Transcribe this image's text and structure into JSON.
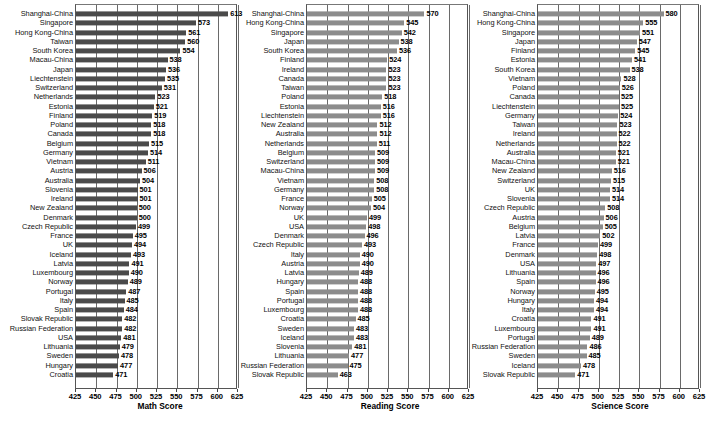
{
  "figure": {
    "panel_count": 3,
    "bar_color_math": "#4a4a4a",
    "bar_color_reading": "#8c8c8c",
    "bar_color_science": "#8c8c8c",
    "grid_color": "#6a6a6a",
    "background": "#ffffff"
  },
  "chart_data": [
    {
      "type": "bar",
      "orientation": "horizontal",
      "title": "",
      "xlabel": "Math Score",
      "ylabel": "",
      "xlim": [
        425,
        625
      ],
      "xticks": [
        425,
        450,
        475,
        500,
        525,
        550,
        575,
        600,
        625
      ],
      "grid": true,
      "legend": "none",
      "color": "#4a4a4a",
      "categories": [
        "Shanghai-China",
        "Singapore",
        "Hong Kong-China",
        "Taiwan",
        "South Korea",
        "Macau-China",
        "Japan",
        "Liechtenstein",
        "Switzerland",
        "Netherlands",
        "Estonia",
        "Finland",
        "Poland",
        "Canada",
        "Belgium",
        "Germany",
        "Vietnam",
        "Austria",
        "Australia",
        "Slovenia",
        "Ireland",
        "New Zealand",
        "Denmark",
        "Czech Republic",
        "France",
        "UK",
        "Iceland",
        "Latvia",
        "Luxembourg",
        "Norway",
        "Portugal",
        "Italy",
        "Spain",
        "Slovak Republic",
        "Russian Federation",
        "USA",
        "Lithuania",
        "Sweden",
        "Hungary",
        "Croatia"
      ],
      "values": [
        613,
        573,
        561,
        560,
        554,
        538,
        536,
        535,
        531,
        523,
        521,
        519,
        518,
        518,
        515,
        514,
        511,
        506,
        504,
        501,
        501,
        500,
        500,
        499,
        495,
        494,
        493,
        491,
        490,
        489,
        487,
        485,
        484,
        482,
        482,
        481,
        479,
        478,
        477,
        471
      ]
    },
    {
      "type": "bar",
      "orientation": "horizontal",
      "title": "",
      "xlabel": "Reading Score",
      "ylabel": "",
      "xlim": [
        425,
        625
      ],
      "xticks": [
        425,
        450,
        475,
        500,
        525,
        550,
        575,
        600,
        625
      ],
      "grid": true,
      "legend": "none",
      "color": "#8c8c8c",
      "categories": [
        "Shanghai-China",
        "Hong Kong-China",
        "Singapore",
        "Japan",
        "South Korea",
        "Finland",
        "Ireland",
        "Canada",
        "Taiwan",
        "Poland",
        "Estonia",
        "Liechtenstein",
        "New Zealand",
        "Australia",
        "Netherlands",
        "Belgium",
        "Switzerland",
        "Macau-China",
        "Vietnam",
        "Germany",
        "France",
        "Norway",
        "UK",
        "USA",
        "Denmark",
        "Czech Republic",
        "Italy",
        "Austria",
        "Latvia",
        "Hungary",
        "Spain",
        "Portugal",
        "Luxembourg",
        "Croatia",
        "Sweden",
        "Iceland",
        "Slovenia",
        "Lithuania",
        "Russian Federation",
        "Slovak Republic"
      ],
      "values": [
        570,
        545,
        542,
        538,
        536,
        524,
        523,
        523,
        523,
        518,
        516,
        516,
        512,
        512,
        511,
        509,
        509,
        509,
        508,
        508,
        505,
        504,
        499,
        498,
        496,
        493,
        490,
        490,
        489,
        488,
        488,
        488,
        488,
        485,
        483,
        483,
        481,
        477,
        475,
        463
      ]
    },
    {
      "type": "bar",
      "orientation": "horizontal",
      "title": "",
      "xlabel": "Science Score",
      "ylabel": "",
      "xlim": [
        425,
        625
      ],
      "xticks": [
        425,
        450,
        475,
        500,
        525,
        550,
        575,
        600,
        625
      ],
      "grid": true,
      "legend": "none",
      "color": "#8c8c8c",
      "categories": [
        "Shanghai-China",
        "Hong Kong-China",
        "Singapore",
        "Japan",
        "Finland",
        "Estonia",
        "South Korea",
        "Vietnam",
        "Poland",
        "Canada",
        "Liechtenstein",
        "Germany",
        "Taiwan",
        "Ireland",
        "Netherlands",
        "Australia",
        "Macau-China",
        "New Zealand",
        "Switzerland",
        "UK",
        "Slovenia",
        "Czech Republic",
        "Austria",
        "Belgium",
        "Latvia",
        "France",
        "Denmark",
        "USA",
        "Lithuania",
        "Spain",
        "Norway",
        "Hungary",
        "Italy",
        "Croatia",
        "Luxembourg",
        "Portugal",
        "Russian Federation",
        "Sweden",
        "Iceland",
        "Slovak Republic"
      ],
      "values": [
        580,
        555,
        551,
        547,
        545,
        541,
        538,
        528,
        526,
        525,
        525,
        524,
        523,
        522,
        522,
        521,
        521,
        516,
        515,
        514,
        514,
        508,
        506,
        505,
        502,
        499,
        498,
        497,
        496,
        496,
        495,
        494,
        494,
        491,
        491,
        489,
        486,
        485,
        478,
        471
      ]
    }
  ]
}
